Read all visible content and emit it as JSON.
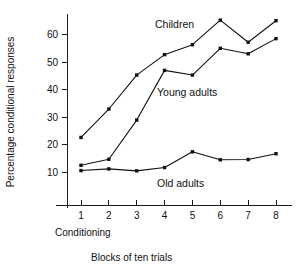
{
  "chart_data": {
    "type": "line",
    "title": "",
    "xlabel": "Blocks of ten trials",
    "ylabel": "Percentage conditional responses",
    "x": [
      1,
      2,
      3,
      4,
      5,
      6,
      7,
      8
    ],
    "categories": [
      "1",
      "2",
      "3",
      "4",
      "5",
      "6",
      "7",
      "8"
    ],
    "xlim": [
      0.6,
      8.4
    ],
    "ylim": [
      5,
      68
    ],
    "yticks": [
      10,
      20,
      30,
      40,
      50,
      60
    ],
    "ytick_labels": [
      "10",
      "20",
      "30",
      "40",
      "50",
      "60"
    ],
    "xticks": [
      1,
      2,
      3,
      4,
      5,
      6,
      7,
      8
    ],
    "xtick_labels": [
      "1",
      "2",
      "3",
      "4",
      "5",
      "6",
      "7",
      "8"
    ],
    "grid": false,
    "legend_position": "inline-annotations",
    "series": [
      {
        "name": "Children",
        "values": [
          22.7,
          33.0,
          45.3,
          52.7,
          56.3,
          65.2,
          57.2,
          65.0
        ],
        "label_x": 4.55,
        "label_y": 63.5,
        "marker": "square",
        "color": "#111111"
      },
      {
        "name": "Young adults",
        "values": [
          12.6,
          14.8,
          29.0,
          47.0,
          45.3,
          55.0,
          53.0,
          58.5
        ],
        "label_x": 4.6,
        "label_y": 41.5,
        "marker": "square",
        "color": "#111111"
      },
      {
        "name": "Old adults",
        "values": [
          10.7,
          11.3,
          10.6,
          11.8,
          17.5,
          14.6,
          14.7,
          16.8
        ],
        "label_x": 4.6,
        "label_y": 7.2,
        "marker": "square",
        "color": "#111111"
      }
    ],
    "annotations": [
      {
        "text": "Children",
        "x": 4.55,
        "y": 63.5
      },
      {
        "text": "Young adults",
        "x": 4.6,
        "y": 41.5
      },
      {
        "text": "Old adults",
        "x": 4.6,
        "y": 7.2
      },
      {
        "text": "Conditioning",
        "x": 1.0,
        "y": -1
      }
    ],
    "xlabel_secondary": "Conditioning"
  },
  "labels": {
    "y_axis_title": "Percentage conditional responses",
    "x_axis_title": "Blocks of ten trials",
    "conditioning": "Conditioning",
    "children": "Children",
    "young_adults": "Young adults",
    "old_adults": "Old adults"
  },
  "ticks": {
    "y": [
      "60",
      "50",
      "40",
      "30",
      "20",
      "10"
    ],
    "x": [
      "1",
      "2",
      "3",
      "4",
      "5",
      "6",
      "7",
      "8"
    ]
  },
  "colors": {
    "line": "#111111",
    "axis": "#1a1a1a",
    "background": "#ffffff"
  }
}
